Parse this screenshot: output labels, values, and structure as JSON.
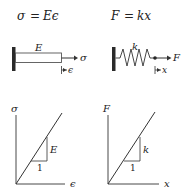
{
  "left": {
    "formula": {
      "lhs": "σ",
      "eq": "=",
      "rhs": "Eϵ"
    },
    "bar": {
      "label": "E",
      "force_label": "σ",
      "displacement_label": "ϵ"
    },
    "graph": {
      "y_label": "σ",
      "x_label": "ϵ",
      "slope_run_label": "1",
      "slope_rise_label": "E"
    }
  },
  "right": {
    "formula": {
      "lhs": "F",
      "eq": "=",
      "rhs": "kx"
    },
    "spring": {
      "label": "k",
      "force_label": "F",
      "displacement_label": "x"
    },
    "graph": {
      "y_label": "F",
      "x_label": "x",
      "slope_run_label": "1",
      "slope_rise_label": "k"
    }
  }
}
